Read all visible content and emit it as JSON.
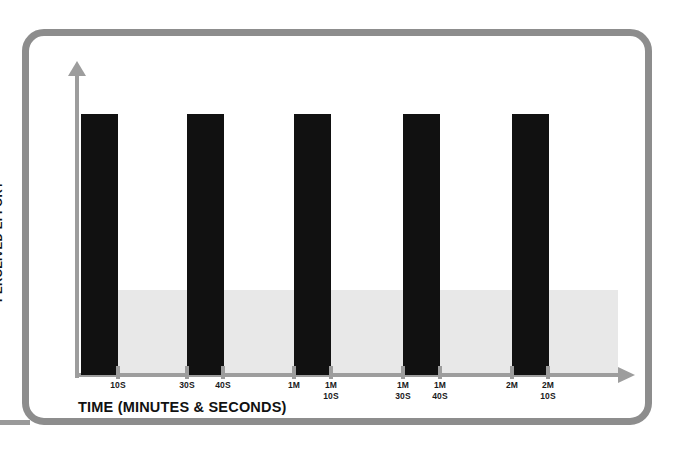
{
  "frame": {
    "border_color": "#8d8d8d"
  },
  "axes": {
    "x_title": "TIME (MINUTES & SECONDS)",
    "y_title": "PERCEIVED EFFORT",
    "axis_color": "#9d9d9d"
  },
  "band": {
    "color": "#e8e8e8"
  },
  "chart_data": {
    "type": "bar",
    "title": "",
    "subtitle": "",
    "xlabel": "TIME (MINUTES & SECONDS)",
    "ylabel": "PERCEIVED EFFORT",
    "grid": false,
    "legend": null,
    "bar_color": "#111111",
    "categories": [
      "10S",
      "30S-40S",
      "1M - 1M 10S",
      "1M 30S - 1M 40S",
      "2M - 2M 10S"
    ],
    "values": [
      100,
      100,
      100,
      100,
      100
    ],
    "ylim": [
      0,
      100
    ],
    "annotation": "Five equal-height effort intervals separated by rest gaps; grey band marks the lower effort threshold region.",
    "tick_labels": [
      {
        "id": "t1",
        "x": 118,
        "lines": [
          "10S"
        ]
      },
      {
        "id": "t2",
        "x": 187,
        "lines": [
          "30S"
        ]
      },
      {
        "id": "t3",
        "x": 223,
        "lines": [
          "40S"
        ]
      },
      {
        "id": "t4",
        "x": 294,
        "lines": [
          "1M"
        ]
      },
      {
        "id": "t5",
        "x": 331,
        "lines": [
          "1M",
          "10S"
        ]
      },
      {
        "id": "t6",
        "x": 403,
        "lines": [
          "1M",
          "30S"
        ]
      },
      {
        "id": "t7",
        "x": 440,
        "lines": [
          "1M",
          "40S"
        ]
      },
      {
        "id": "t8",
        "x": 512,
        "lines": [
          "2M"
        ]
      },
      {
        "id": "t9",
        "x": 548,
        "lines": [
          "2M",
          "10S"
        ]
      }
    ],
    "bars": [
      {
        "id": "bar-1",
        "x": 81,
        "label": "10S"
      },
      {
        "id": "bar-2",
        "x": 187,
        "label": "30S-40S"
      },
      {
        "id": "bar-3",
        "x": 294,
        "label": "1M-1M 10S"
      },
      {
        "id": "bar-4",
        "x": 403,
        "label": "1M 30S-1M 40S"
      },
      {
        "id": "bar-5",
        "x": 512,
        "label": "2M-2M 10S"
      }
    ]
  }
}
